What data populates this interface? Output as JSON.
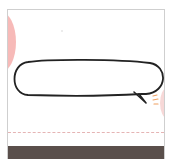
{
  "illustration": {
    "description": "speech bubble doodle card",
    "colors": {
      "card_border": "#cfcfcf",
      "left_circle": "#f6b3b0",
      "right_circle": "#f4c8c6",
      "bubble_stroke": "#222222",
      "accent_strokes": "#f0a060",
      "dashed_line": "#e5b4b4",
      "bottom_bar": "#5a4f4b"
    }
  }
}
